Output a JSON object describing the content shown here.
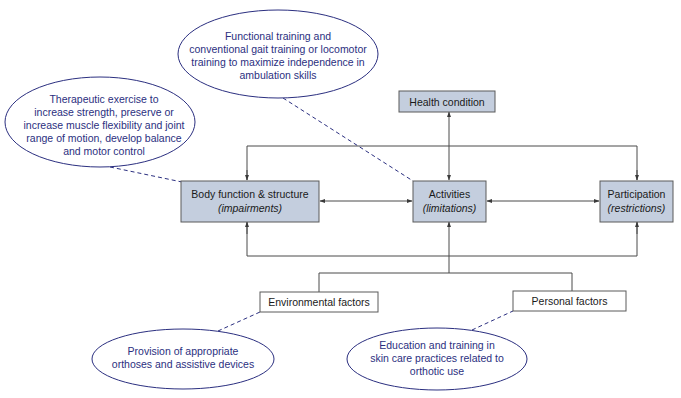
{
  "colors": {
    "box_fill": "#c4cede",
    "box_stroke": "#5a5a5a",
    "plain_box_fill": "#ffffff",
    "line": "#4a4a4a",
    "ellipse_stroke": "#2b2f80",
    "ellipse_text": "#2b2f80"
  },
  "nodes": {
    "health_condition": {
      "label": "Health condition"
    },
    "body_function": {
      "label": "Body function & structure",
      "sublabel": "(impairments)"
    },
    "activities": {
      "label": "Activities",
      "sublabel": "(limitations)"
    },
    "participation": {
      "label": "Participation",
      "sublabel": "(restrictions)"
    },
    "environmental_factors": {
      "label": "Environmental factors"
    },
    "personal_factors": {
      "label": "Personal factors"
    }
  },
  "callouts": {
    "functional_training": {
      "lines": [
        "Functional training and",
        "conventional gait training or locomotor",
        "training to maximize independence in",
        "ambulation skills"
      ],
      "target": "activities"
    },
    "therapeutic_exercise": {
      "lines": [
        "Therapeutic exercise to",
        "increase strength, preserve or",
        "increase muscle flexibility and joint",
        "range of motion, develop balance",
        "and motor control"
      ],
      "target": "body_function"
    },
    "provision": {
      "lines": [
        "Provision of appropriate",
        "orthoses and assistive devices"
      ],
      "target": "environmental_factors"
    },
    "education": {
      "lines": [
        "Education and training in",
        "skin care practices related to",
        "orthotic use"
      ],
      "target": "personal_factors"
    }
  },
  "edges": [
    {
      "from": "health_condition",
      "to": "activities",
      "type": "bidirectional"
    },
    {
      "from": "body_function",
      "to": "activities",
      "type": "bidirectional"
    },
    {
      "from": "activities",
      "to": "participation",
      "type": "bidirectional"
    },
    {
      "from": "top_bus",
      "to": "body_function",
      "type": "arrow"
    },
    {
      "from": "top_bus",
      "to": "participation",
      "type": "arrow"
    },
    {
      "from": "bottom_bus",
      "to": "body_function",
      "type": "arrow"
    },
    {
      "from": "bottom_bus",
      "to": "participation",
      "type": "arrow"
    },
    {
      "from": "contextual_factors",
      "to": "activities",
      "type": "arrow"
    },
    {
      "from": "environmental_factors",
      "to": "contextual_factors",
      "type": "line"
    },
    {
      "from": "personal_factors",
      "to": "contextual_factors",
      "type": "line"
    }
  ]
}
